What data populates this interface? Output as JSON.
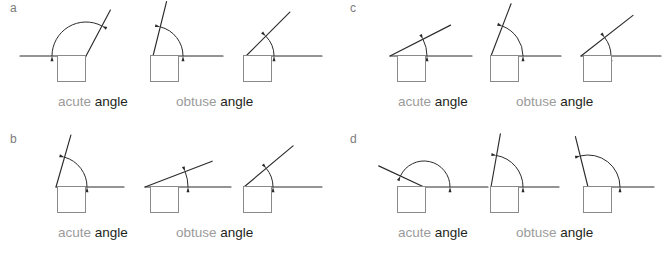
{
  "worksheet": {
    "title": "Acute and obtuse angle identification worksheet",
    "stroke_color": "#2b2b2b",
    "box_border_color": "#8a8a8a",
    "kind_label_color": "#9b9b9b",
    "word_label_color": "#231f20",
    "panel_letter_color": "#7b7b7b"
  },
  "panels": [
    {
      "letter": "a",
      "figures": [
        {
          "name": "angle-figure-a1",
          "angle_degrees": 118,
          "classification": "obtuse",
          "arc_radius": 34,
          "vertex": {
            "x": 48,
            "y": 54
          },
          "ray_length": 52,
          "baseline_direction": "left"
        },
        {
          "name": "angle-figure-a2",
          "angle_degrees": 76,
          "classification": "acute",
          "arc_radius": 30,
          "vertex": {
            "x": 20,
            "y": 54
          },
          "ray_length": 56,
          "baseline_direction": "right"
        },
        {
          "name": "angle-figure-a3",
          "angle_degrees": 45,
          "classification": "acute",
          "arc_radius": 28,
          "vertex": {
            "x": 18,
            "y": 54
          },
          "ray_length": 62,
          "baseline_direction": "right"
        }
      ],
      "answer_boxes": [
        "",
        "",
        ""
      ],
      "labels": {
        "acute": {
          "kind": "acute",
          "word": "angle"
        },
        "obtuse": {
          "kind": "obtuse",
          "word": "angle"
        }
      }
    },
    {
      "letter": "b",
      "figures": [
        {
          "name": "angle-figure-b1",
          "angle_degrees": 74,
          "classification": "acute",
          "arc_radius": 31,
          "vertex": {
            "x": 18,
            "y": 54
          },
          "ray_length": 54,
          "baseline_direction": "right"
        },
        {
          "name": "angle-figure-b2",
          "angle_degrees": 21,
          "classification": "acute",
          "arc_radius": 43,
          "vertex": {
            "x": 12,
            "y": 54
          },
          "ray_length": 72,
          "baseline_direction": "right"
        },
        {
          "name": "angle-figure-b3",
          "angle_degrees": 40,
          "classification": "acute",
          "arc_radius": 29,
          "vertex": {
            "x": 16,
            "y": 54
          },
          "ray_length": 64,
          "baseline_direction": "right"
        }
      ],
      "answer_boxes": [
        "",
        "",
        ""
      ],
      "labels": {
        "acute": {
          "kind": "acute",
          "word": "angle"
        },
        "obtuse": {
          "kind": "obtuse",
          "word": "angle"
        }
      }
    },
    {
      "letter": "c",
      "figures": [
        {
          "name": "angle-figure-c1",
          "angle_degrees": 27,
          "classification": "acute",
          "arc_radius": 37,
          "vertex": {
            "x": 12,
            "y": 54
          },
          "ray_length": 68,
          "baseline_direction": "right"
        },
        {
          "name": "angle-figure-c2",
          "angle_degrees": 69,
          "classification": "acute",
          "arc_radius": 32,
          "vertex": {
            "x": 18,
            "y": 54
          },
          "ray_length": 56,
          "baseline_direction": "right"
        },
        {
          "name": "angle-figure-c3",
          "angle_degrees": 38,
          "classification": "acute",
          "arc_radius": 30,
          "vertex": {
            "x": 16,
            "y": 54
          },
          "ray_length": 66,
          "baseline_direction": "right"
        }
      ],
      "answer_boxes": [
        "",
        "",
        ""
      ],
      "labels": {
        "acute": {
          "kind": "acute",
          "word": "angle"
        },
        "obtuse": {
          "kind": "obtuse",
          "word": "angle"
        }
      }
    },
    {
      "letter": "d",
      "figures": [
        {
          "name": "angle-figure-d1",
          "angle_degrees": 155,
          "classification": "obtuse",
          "arc_radius": 26,
          "vertex": {
            "x": 46,
            "y": 54
          },
          "ray_length": 50,
          "baseline_direction": "right"
        },
        {
          "name": "angle-figure-d2",
          "angle_degrees": 80,
          "classification": "acute",
          "arc_radius": 32,
          "vertex": {
            "x": 18,
            "y": 54
          },
          "ray_length": 54,
          "baseline_direction": "right"
        },
        {
          "name": "angle-figure-d3",
          "angle_degrees": 104,
          "classification": "obtuse",
          "arc_radius": 32,
          "vertex": {
            "x": 20,
            "y": 54
          },
          "ray_length": 52,
          "baseline_direction": "right"
        }
      ],
      "answer_boxes": [
        "",
        "",
        ""
      ],
      "labels": {
        "acute": {
          "kind": "acute",
          "word": "angle"
        },
        "obtuse": {
          "kind": "obtuse",
          "word": "angle"
        }
      }
    }
  ]
}
